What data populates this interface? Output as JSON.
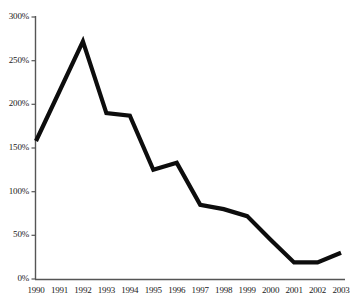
{
  "chart_data": {
    "type": "line",
    "title": "",
    "subtitle": "",
    "xlabel": "",
    "ylabel": "",
    "categories": [
      "1990",
      "1991",
      "1992",
      "1993",
      "1994",
      "1995",
      "1996",
      "1997",
      "1998",
      "1999",
      "2000",
      "2001",
      "2002",
      "2003"
    ],
    "values": [
      158,
      215,
      272,
      190,
      187,
      125,
      133,
      85,
      80,
      72,
      45,
      19,
      19,
      30
    ],
    "series": [
      {
        "name": "",
        "values": [
          158,
          215,
          272,
          190,
          187,
          125,
          133,
          85,
          80,
          72,
          45,
          19,
          19,
          30
        ]
      }
    ],
    "ylim": [
      0,
      300
    ],
    "y_ticks": [
      0,
      50,
      100,
      150,
      200,
      250,
      300
    ],
    "y_tick_labels": [
      "0%",
      "50%",
      "100%",
      "150%",
      "200%",
      "250%",
      "300%"
    ],
    "x_tick_labels": [
      "1990",
      "1991",
      "1992",
      "1993",
      "1994",
      "1995",
      "1996",
      "1997",
      "1998",
      "1999",
      "2000",
      "2001",
      "2002",
      "2003"
    ],
    "grid": false,
    "legend": null,
    "legend_position": "none",
    "annotations": [],
    "line_color": "#0d0d0d",
    "axis_color": "#555555",
    "background_color": "#ffffff",
    "line_width": 4.2
  }
}
